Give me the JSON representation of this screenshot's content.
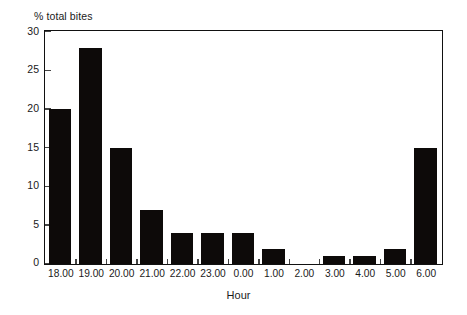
{
  "chart_data": {
    "type": "bar",
    "title": "",
    "subtitle": "",
    "xlabel": "Hour",
    "ylabel": "% total bites",
    "categories": [
      "18.00",
      "19.00",
      "20.00",
      "21.00",
      "22.00",
      "23.00",
      "0.00",
      "1.00",
      "2.00",
      "3.00",
      "4.00",
      "5.00",
      "6.00"
    ],
    "values": [
      20,
      28,
      15,
      7,
      4,
      4,
      4,
      2,
      0,
      1,
      1,
      2,
      15
    ],
    "ylim": [
      0,
      30
    ],
    "yticks": [
      0,
      5,
      10,
      15,
      20,
      25,
      30
    ],
    "ytick_labels": [
      "0",
      "5",
      "10",
      "15",
      "20",
      "25",
      "30"
    ],
    "grid": false,
    "legend": null,
    "bar_color": "#0d0a09",
    "axis_color": "#111111",
    "background": "#ffffff",
    "annotations": []
  }
}
